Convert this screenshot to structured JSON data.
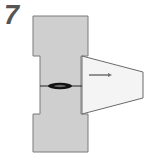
{
  "step": {
    "number": "7"
  },
  "diagram": {
    "colors": {
      "block_fill": "#cfcfcf",
      "block_stroke": "#7a7a7a",
      "wedge_fill": "#f4f4f4",
      "wedge_stroke": "#6a6a6a",
      "seam": "#111111",
      "arrow": "#707070"
    },
    "arrow": {
      "direction": "right"
    }
  }
}
